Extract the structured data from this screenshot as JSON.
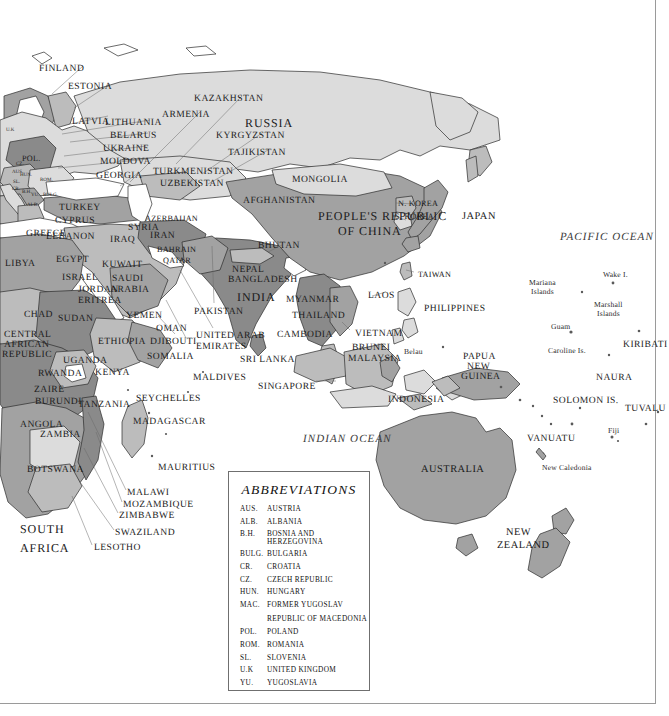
{
  "map": {
    "title": "World map of Asia, Africa, Europe and Oceania",
    "projection_note": "eastern hemisphere political map",
    "colors": {
      "ocean": "#ffffff",
      "land_light": "#d9d9d9",
      "land_mid": "#b8b8b8",
      "land_dark": "#9a9a9a",
      "land_darker": "#818181",
      "border_line": "#2b2b2b",
      "frame": "#9a9a9a",
      "label_text": "#1a1a1a"
    },
    "oceans": [
      {
        "name": "PACIFIC OCEAN",
        "x": 560,
        "y": 232
      },
      {
        "name": "INDIAN OCEAN",
        "x": 303,
        "y": 434
      }
    ],
    "countries": [
      {
        "name": "FINLAND",
        "x": 39,
        "y": 64,
        "size": "ctry",
        "align": "left",
        "leader": [
          [
            83,
            67
          ],
          [
            50,
            93
          ]
        ]
      },
      {
        "name": "ESTONIA",
        "x": 68,
        "y": 82,
        "size": "ctry",
        "align": "left",
        "leader": [
          [
            112,
            85
          ],
          [
            70,
            109
          ]
        ]
      },
      {
        "name": "LATVIA",
        "x": 72,
        "y": 117,
        "size": "ctry",
        "align": "left",
        "leader": [
          [
            108,
            117
          ],
          [
            68,
            124
          ]
        ]
      },
      {
        "name": "LITHUANIA",
        "x": 105,
        "y": 118,
        "size": "ctry",
        "align": "left",
        "leader": [
          [
            104,
            122
          ],
          [
            60,
            133
          ]
        ]
      },
      {
        "name": "BELARUS",
        "x": 110,
        "y": 131,
        "size": "ctry",
        "align": "left",
        "leader": [
          [
            110,
            134
          ],
          [
            72,
            142
          ]
        ]
      },
      {
        "name": "UKRAINE",
        "x": 103,
        "y": 144,
        "size": "ctry",
        "align": "left",
        "leader": [
          [
            102,
            147
          ],
          [
            62,
            157
          ]
        ]
      },
      {
        "name": "MOLDOVA",
        "x": 100,
        "y": 157,
        "size": "ctry",
        "align": "left",
        "leader": [
          [
            99,
            160
          ],
          [
            56,
            168
          ]
        ]
      },
      {
        "name": "GEORGIA",
        "x": 96,
        "y": 171,
        "size": "ctry",
        "align": "left",
        "leader": [
          [
            138,
            173
          ],
          [
            118,
            184
          ]
        ]
      },
      {
        "name": "POL.",
        "x": 22,
        "y": 155,
        "size": "sm",
        "align": "left"
      },
      {
        "name": "KAZAKHSTAN",
        "x": 194,
        "y": 94,
        "size": "ctry",
        "align": "left",
        "leader": [
          [
            208,
            98
          ],
          [
            175,
            163
          ]
        ]
      },
      {
        "name": "ARMENIA",
        "x": 162,
        "y": 110,
        "size": "ctry",
        "align": "left",
        "leader": [
          [
            165,
            114
          ],
          [
            128,
            181
          ]
        ]
      },
      {
        "name": "RUSSIA",
        "x": 245,
        "y": 117,
        "size": "big",
        "align": "left"
      },
      {
        "name": "KYRGYZSTAN",
        "x": 216,
        "y": 131,
        "size": "ctry",
        "align": "left",
        "leader": [
          [
            216,
            134
          ],
          [
            200,
            172
          ]
        ]
      },
      {
        "name": "TAJIKISTAN",
        "x": 228,
        "y": 148,
        "size": "ctry",
        "align": "left",
        "leader": [
          [
            228,
            151
          ],
          [
            205,
            182
          ]
        ]
      },
      {
        "name": "TURKMENISTAN",
        "x": 153,
        "y": 167,
        "size": "ctry",
        "align": "left"
      },
      {
        "name": "UZBEKISTAN",
        "x": 160,
        "y": 179,
        "size": "ctry",
        "align": "left"
      },
      {
        "name": "MONGOLIA",
        "x": 292,
        "y": 175,
        "size": "ctry",
        "align": "left"
      },
      {
        "name": "AFGHANISTAN",
        "x": 243,
        "y": 196,
        "size": "ctry",
        "align": "left"
      },
      {
        "name": "PEOPLE'S REPUBLIC",
        "x": 318,
        "y": 210,
        "size": "big",
        "align": "left"
      },
      {
        "name": "OF CHINA",
        "x": 338,
        "y": 225,
        "size": "big",
        "align": "left"
      },
      {
        "name": "AZERBAIJAN",
        "x": 145,
        "y": 215,
        "size": "sm",
        "align": "left"
      },
      {
        "name": "TURKEY",
        "x": 59,
        "y": 203,
        "size": "ctry",
        "align": "left"
      },
      {
        "name": "CYPRUS",
        "x": 55,
        "y": 216,
        "size": "ctry",
        "align": "left"
      },
      {
        "name": "GREECE",
        "x": 26,
        "y": 229,
        "size": "ctry",
        "align": "left"
      },
      {
        "name": "SYRIA",
        "x": 128,
        "y": 223,
        "size": "ctry",
        "align": "left"
      },
      {
        "name": "IRAQ",
        "x": 110,
        "y": 235,
        "size": "ctry",
        "align": "left"
      },
      {
        "name": "IRAN",
        "x": 150,
        "y": 231,
        "size": "ctry",
        "align": "left"
      },
      {
        "name": "LEBANON",
        "x": 46,
        "y": 232,
        "size": "ctry",
        "align": "left"
      },
      {
        "name": "BAHRAIN",
        "x": 157,
        "y": 246,
        "size": "sm",
        "align": "left"
      },
      {
        "name": "QATAR",
        "x": 163,
        "y": 257,
        "size": "sm",
        "align": "left"
      },
      {
        "name": "EGYPT",
        "x": 56,
        "y": 255,
        "size": "ctry",
        "align": "left"
      },
      {
        "name": "LIBYA",
        "x": 5,
        "y": 259,
        "size": "ctry",
        "align": "left"
      },
      {
        "name": "KUWAIT",
        "x": 102,
        "y": 260,
        "size": "ctry",
        "align": "left"
      },
      {
        "name": "ISRAEL",
        "x": 62,
        "y": 273,
        "size": "ctry",
        "align": "left"
      },
      {
        "name": "SAUDI",
        "x": 112,
        "y": 274,
        "size": "ctry",
        "align": "left"
      },
      {
        "name": "ARABIA",
        "x": 110,
        "y": 285,
        "size": "ctry",
        "align": "left"
      },
      {
        "name": "JORDAN",
        "x": 78,
        "y": 285,
        "size": "ctry",
        "align": "left"
      },
      {
        "name": "ERITREA",
        "x": 78,
        "y": 296,
        "size": "ctry",
        "align": "left"
      },
      {
        "name": "CHAD",
        "x": 24,
        "y": 310,
        "size": "ctry",
        "align": "left"
      },
      {
        "name": "SUDAN",
        "x": 58,
        "y": 314,
        "size": "ctry",
        "align": "left"
      },
      {
        "name": "YEMEN",
        "x": 126,
        "y": 311,
        "size": "ctry",
        "align": "left"
      },
      {
        "name": "OMAN",
        "x": 156,
        "y": 324,
        "size": "ctry",
        "align": "left"
      },
      {
        "name": "CENTRAL",
        "x": 4,
        "y": 330,
        "size": "ctry",
        "align": "left"
      },
      {
        "name": "AFRICAN",
        "x": 4,
        "y": 340,
        "size": "ctry",
        "align": "left"
      },
      {
        "name": "REPUBLIC",
        "x": 2,
        "y": 350,
        "size": "ctry",
        "align": "left"
      },
      {
        "name": "ETHIOPIA",
        "x": 98,
        "y": 337,
        "size": "ctry",
        "align": "left"
      },
      {
        "name": "DJIBOUTI",
        "x": 150,
        "y": 337,
        "size": "ctry",
        "align": "left"
      },
      {
        "name": "UGANDA",
        "x": 63,
        "y": 356,
        "size": "ctry",
        "align": "left"
      },
      {
        "name": "SOMALIA",
        "x": 147,
        "y": 352,
        "size": "ctry",
        "align": "left"
      },
      {
        "name": "RWANDA",
        "x": 38,
        "y": 369,
        "size": "ctry",
        "align": "left"
      },
      {
        "name": "KENYA",
        "x": 95,
        "y": 368,
        "size": "ctry",
        "align": "left"
      },
      {
        "name": "ZAIRE",
        "x": 34,
        "y": 385,
        "size": "ctry",
        "align": "left"
      },
      {
        "name": "SEYCHELLES",
        "x": 136,
        "y": 394,
        "size": "ctry",
        "align": "left"
      },
      {
        "name": "BURUNDI",
        "x": 35,
        "y": 397,
        "size": "ctry",
        "align": "left"
      },
      {
        "name": "TANZANIA",
        "x": 78,
        "y": 400,
        "size": "ctry",
        "align": "left"
      },
      {
        "name": "MADAGASCAR",
        "x": 133,
        "y": 417,
        "size": "ctry",
        "align": "left"
      },
      {
        "name": "ANGOLA",
        "x": 20,
        "y": 420,
        "size": "ctry",
        "align": "left"
      },
      {
        "name": "ZAMBIA",
        "x": 40,
        "y": 430,
        "size": "ctry",
        "align": "left"
      },
      {
        "name": "MAURITIUS",
        "x": 158,
        "y": 463,
        "size": "ctry",
        "align": "left"
      },
      {
        "name": "BOTSWANA",
        "x": 27,
        "y": 465,
        "size": "ctry",
        "align": "left"
      },
      {
        "name": "MALAWI",
        "x": 127,
        "y": 488,
        "size": "ctry",
        "align": "left",
        "leader": [
          [
            126,
            491
          ],
          [
            88,
            410
          ]
        ]
      },
      {
        "name": "MOZAMBIQUE",
        "x": 123,
        "y": 500,
        "size": "ctry",
        "align": "left",
        "leader": [
          [
            122,
            503
          ],
          [
            96,
            430
          ]
        ]
      },
      {
        "name": "ZIMBABWE",
        "x": 119,
        "y": 511,
        "size": "ctry",
        "align": "left",
        "leader": [
          [
            118,
            514
          ],
          [
            82,
            446
          ]
        ]
      },
      {
        "name": "SOUTH",
        "x": 20,
        "y": 523,
        "size": "big",
        "align": "left"
      },
      {
        "name": "AFRICA",
        "x": 20,
        "y": 542,
        "size": "big",
        "align": "left"
      },
      {
        "name": "SWAZILAND",
        "x": 115,
        "y": 528,
        "size": "ctry",
        "align": "left",
        "leader": [
          [
            114,
            531
          ],
          [
            80,
            480
          ]
        ]
      },
      {
        "name": "LESOTHO",
        "x": 94,
        "y": 543,
        "size": "ctry",
        "align": "left",
        "leader": [
          [
            93,
            546
          ],
          [
            73,
            495
          ]
        ]
      },
      {
        "name": "PAKISTAN",
        "x": 194,
        "y": 307,
        "size": "ctry",
        "align": "left",
        "leader": [
          [
            214,
            303
          ],
          [
            212,
            245
          ]
        ]
      },
      {
        "name": "NEPAL",
        "x": 232,
        "y": 265,
        "size": "ctry",
        "align": "left"
      },
      {
        "name": "BANGLADESH",
        "x": 228,
        "y": 275,
        "size": "ctry",
        "align": "left"
      },
      {
        "name": "INDIA",
        "x": 237,
        "y": 291,
        "size": "big",
        "align": "left"
      },
      {
        "name": "BHUTAN",
        "x": 258,
        "y": 241,
        "size": "ctry",
        "align": "left"
      },
      {
        "name": "MYANMAR",
        "x": 286,
        "y": 295,
        "size": "ctry",
        "align": "left"
      },
      {
        "name": "THAILAND",
        "x": 292,
        "y": 311,
        "size": "ctry",
        "align": "left"
      },
      {
        "name": "LAOS",
        "x": 368,
        "y": 291,
        "size": "ctry",
        "align": "left"
      },
      {
        "name": "CAMBODIA",
        "x": 277,
        "y": 330,
        "size": "ctry",
        "align": "left"
      },
      {
        "name": "VIETNAM",
        "x": 355,
        "y": 329,
        "size": "ctry",
        "align": "left"
      },
      {
        "name": "BRUNEI",
        "x": 352,
        "y": 343,
        "size": "ctry",
        "align": "left"
      },
      {
        "name": "MALAYSIA",
        "x": 348,
        "y": 354,
        "size": "ctry",
        "align": "left"
      },
      {
        "name": "UNITED ARAB",
        "x": 196,
        "y": 331,
        "size": "ctry",
        "align": "left",
        "leader": [
          [
            212,
            328
          ],
          [
            178,
            268
          ]
        ]
      },
      {
        "name": "EMIRATES",
        "x": 196,
        "y": 342,
        "size": "ctry",
        "align": "left"
      },
      {
        "name": "SRI LANKA",
        "x": 240,
        "y": 355,
        "size": "ctry",
        "align": "left"
      },
      {
        "name": "MALDIVES",
        "x": 193,
        "y": 373,
        "size": "ctry",
        "align": "left"
      },
      {
        "name": "SINGAPORE",
        "x": 258,
        "y": 382,
        "size": "ctry",
        "align": "left",
        "leader": [
          [
            318,
            382
          ],
          [
            338,
            382
          ]
        ]
      },
      {
        "name": "INDONESIA",
        "x": 388,
        "y": 395,
        "size": "ctry",
        "align": "left"
      },
      {
        "name": "PHILIPPINES",
        "x": 424,
        "y": 304,
        "size": "ctry",
        "align": "left"
      },
      {
        "name": "TAIWAN",
        "x": 418,
        "y": 271,
        "size": "sm",
        "align": "left"
      },
      {
        "name": "N. KOREA",
        "x": 398,
        "y": 200,
        "size": "sm",
        "align": "left"
      },
      {
        "name": "S. KOREA",
        "x": 395,
        "y": 213,
        "size": "sm",
        "align": "left"
      },
      {
        "name": "JAPAN",
        "x": 462,
        "y": 212,
        "size": "med",
        "align": "left"
      },
      {
        "name": "AUSTRALIA",
        "x": 421,
        "y": 465,
        "size": "med",
        "align": "left"
      },
      {
        "name": "NEW",
        "x": 506,
        "y": 528,
        "size": "med",
        "align": "left"
      },
      {
        "name": "ZEALAND",
        "x": 497,
        "y": 541,
        "size": "med",
        "align": "left"
      },
      {
        "name": "PAPUA",
        "x": 463,
        "y": 352,
        "size": "ctry",
        "align": "left"
      },
      {
        "name": "NEW",
        "x": 467,
        "y": 362,
        "size": "ctry",
        "align": "left"
      },
      {
        "name": "GUINEA",
        "x": 461,
        "y": 372,
        "size": "ctry",
        "align": "left"
      },
      {
        "name": "KIRIBATI",
        "x": 623,
        "y": 340,
        "size": "ctry",
        "align": "left"
      },
      {
        "name": "NAURA",
        "x": 596,
        "y": 373,
        "size": "ctry",
        "align": "left"
      },
      {
        "name": "TUVALU",
        "x": 625,
        "y": 404,
        "size": "ctry",
        "align": "left"
      },
      {
        "name": "SOLOMON IS.",
        "x": 553,
        "y": 396,
        "size": "ctry",
        "align": "left"
      },
      {
        "name": "VANUATU",
        "x": 527,
        "y": 434,
        "size": "ctry",
        "align": "left"
      },
      {
        "name": "SWAZILAND2",
        "x": -999,
        "y": -999,
        "size": "ctry",
        "align": "left"
      }
    ],
    "islands": [
      {
        "name": "Wake I.",
        "x": 603,
        "y": 271
      },
      {
        "name": "Mariana",
        "x": 529,
        "y": 279
      },
      {
        "name": "Islands",
        "x": 531,
        "y": 288
      },
      {
        "name": "Marshall",
        "x": 594,
        "y": 301
      },
      {
        "name": "Islands",
        "x": 597,
        "y": 310
      },
      {
        "name": "Guam",
        "x": 551,
        "y": 323
      },
      {
        "name": "Caroline Is.",
        "x": 548,
        "y": 347
      },
      {
        "name": "Belau",
        "x": 404,
        "y": 348
      },
      {
        "name": "Fiji",
        "x": 608,
        "y": 427
      },
      {
        "name": "New Caledonia",
        "x": 542,
        "y": 464
      }
    ],
    "balkan_abbrevs": [
      {
        "code": "AUS.",
        "x": 12,
        "y": 170
      },
      {
        "code": "CZ.",
        "x": 16,
        "y": 162
      },
      {
        "code": "HUN.",
        "x": 20,
        "y": 173
      },
      {
        "code": "ROM.",
        "x": 40,
        "y": 178
      },
      {
        "code": "SL.",
        "x": 13,
        "y": 180
      },
      {
        "code": "CR.",
        "x": 12,
        "y": 187
      },
      {
        "code": "B.H.",
        "x": 22,
        "y": 190
      },
      {
        "code": "YU.",
        "x": 31,
        "y": 193
      },
      {
        "code": "BULG.",
        "x": 43,
        "y": 193
      },
      {
        "code": "ALB.",
        "x": 27,
        "y": 203
      },
      {
        "code": "U.K",
        "x": 6,
        "y": 128
      }
    ]
  },
  "abbreviations": {
    "title": "ABBREVIATIONS",
    "rows": [
      {
        "code": "AUS.",
        "name": "AUSTRIA"
      },
      {
        "code": "ALB.",
        "name": "ALBANIA"
      },
      {
        "code": "B.H.",
        "name": "BOSNIA AND HERZEGOVINA"
      },
      {
        "code": "BULG.",
        "name": "BULGARIA"
      },
      {
        "code": "CR.",
        "name": "CROATIA"
      },
      {
        "code": "CZ.",
        "name": "CZECH REPUBLIC"
      },
      {
        "code": "HUN.",
        "name": "HUNGARY"
      },
      {
        "code": "MAC.",
        "name": "FORMER YUGOSLAV",
        "cont": "REPUBLIC OF MACEDONIA"
      },
      {
        "code": "POL.",
        "name": "POLAND"
      },
      {
        "code": "ROM.",
        "name": "ROMANIA"
      },
      {
        "code": "SL.",
        "name": "SLOVENIA"
      },
      {
        "code": "U.K",
        "name": "UNITED KINGDOM"
      },
      {
        "code": "YU.",
        "name": "YUGOSLAVIA"
      }
    ]
  }
}
